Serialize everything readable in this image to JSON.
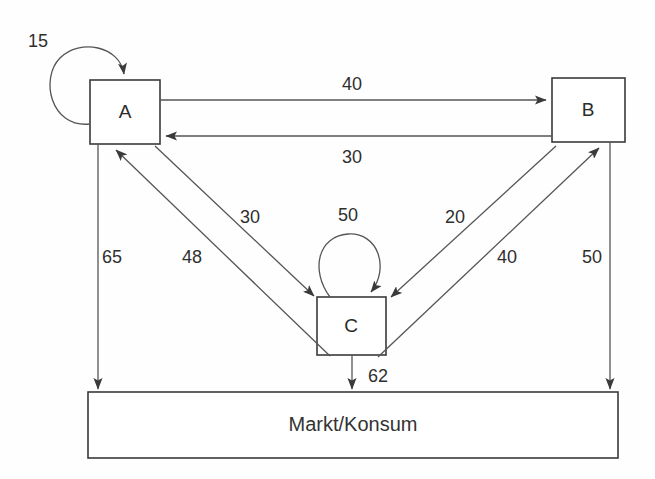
{
  "diagram": {
    "title": "Markt/Konsum",
    "nodes": [
      {
        "id": "A",
        "label": "A",
        "x": 90,
        "y": 80,
        "w": 70,
        "h": 64
      },
      {
        "id": "B",
        "label": "B",
        "x": 552,
        "y": 78,
        "w": 73,
        "h": 64
      },
      {
        "id": "C",
        "label": "C",
        "x": 317,
        "y": 297,
        "w": 69,
        "h": 58
      },
      {
        "id": "MARKT",
        "label": "Markt/Konsum",
        "x": 88,
        "y": 392,
        "w": 530,
        "h": 66
      }
    ],
    "flows": [
      {
        "id": "a-self",
        "from": "A",
        "to": "A",
        "value": "15",
        "label_x": 38,
        "label_y": 42
      },
      {
        "id": "a-to-b",
        "from": "A",
        "to": "B",
        "value": "40",
        "label_x": 352,
        "label_y": 85
      },
      {
        "id": "b-to-a",
        "from": "B",
        "to": "A",
        "value": "30",
        "label_x": 352,
        "label_y": 158
      },
      {
        "id": "a-to-c",
        "from": "A",
        "to": "C",
        "value": "30",
        "label_x": 250,
        "label_y": 218
      },
      {
        "id": "c-to-a",
        "from": "C",
        "to": "A",
        "value": "48",
        "label_x": 192,
        "label_y": 258
      },
      {
        "id": "b-to-c",
        "from": "B",
        "to": "C",
        "value": "20",
        "label_x": 455,
        "label_y": 218
      },
      {
        "id": "c-to-b",
        "from": "C",
        "to": "B",
        "value": "40",
        "label_x": 507,
        "label_y": 258
      },
      {
        "id": "c-self",
        "from": "C",
        "to": "C",
        "value": "50",
        "label_x": 348,
        "label_y": 216
      },
      {
        "id": "a-to-markt",
        "from": "A",
        "to": "MARKT",
        "value": "65",
        "label_x": 112,
        "label_y": 258
      },
      {
        "id": "c-to-markt",
        "from": "C",
        "to": "MARKT",
        "value": "62",
        "label_x": 378,
        "label_y": 377
      },
      {
        "id": "b-to-markt",
        "from": "B",
        "to": "MARKT",
        "value": "50",
        "label_x": 592,
        "label_y": 258
      }
    ],
    "colors": {
      "stroke": "#555555",
      "box_stroke": "#3a3a3a",
      "text": "#2b2b2b",
      "background": "#fefefe"
    }
  }
}
